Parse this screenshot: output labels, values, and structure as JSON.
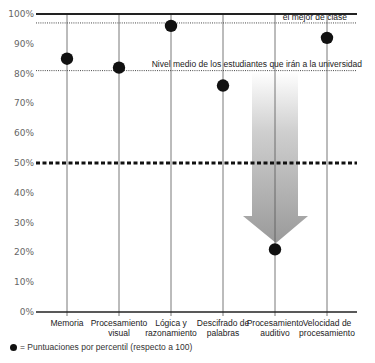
{
  "chart_data": {
    "type": "scatter",
    "title": "",
    "xlabel": "",
    "ylabel": "",
    "ylim": [
      0,
      100
    ],
    "yticks": [
      "0%",
      "10%",
      "20%",
      "30%",
      "40%",
      "50%",
      "60%",
      "70%",
      "80%",
      "90%",
      "100%"
    ],
    "categories": [
      [
        "Memoria"
      ],
      [
        "Procesamiento",
        "visual"
      ],
      [
        "Lógica y",
        "razonamiento"
      ],
      [
        "Descifrado de",
        "palabras"
      ],
      [
        "Procesamiento",
        "auditivo"
      ],
      [
        "Velocidad de",
        "procesamiento"
      ]
    ],
    "values": [
      85,
      82,
      96,
      76,
      21,
      92
    ],
    "series": [
      {
        "name": "Puntuaciones por percentil (respecto a 100)",
        "values": [
          85,
          82,
          96,
          76,
          21,
          92
        ]
      }
    ],
    "reference_lines": [
      {
        "label": "el mejor de clase",
        "value": 97,
        "style": "dotted"
      },
      {
        "label": "Nivel medio de los estudiantes que irán a la universidad",
        "value": 81,
        "style": "dotted"
      },
      {
        "label": "",
        "value": 50,
        "style": "dashed-bold"
      }
    ],
    "annotations": [
      {
        "type": "arrow",
        "category_index": 4,
        "from": 81,
        "to": 23,
        "color": "#999999"
      }
    ],
    "legend": {
      "position": "bottom-left",
      "marker": "●",
      "text": "= Puntuaciones por percentil (respecto a 100)"
    },
    "grid": false
  },
  "colors": {
    "axis": "#222222",
    "dot": "#111111",
    "arrow": "#9a9a9a",
    "tick_text": "#666666"
  }
}
